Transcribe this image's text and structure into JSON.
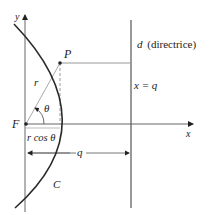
{
  "diagram": {
    "type": "parabola-focus-directrix",
    "colors": {
      "curve": "#2a2a2a",
      "axis": "#555555",
      "guide": "#9a9a9a",
      "text": "#222222"
    },
    "labels": {
      "y_axis": "y",
      "x_axis": "x",
      "focus": "F",
      "point": "P",
      "radius": "r",
      "angle": "θ",
      "projection": "r cos θ",
      "directrix_var": "d",
      "directrix_note": "(directrice)",
      "directrix_eq": "x = q",
      "distance": "q",
      "curve": "C"
    }
  }
}
